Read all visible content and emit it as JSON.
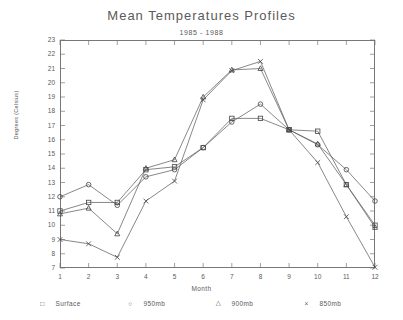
{
  "chart_data": {
    "type": "line",
    "title": "Mean Temperatures Profiles",
    "subtitle": "1985 - 1988",
    "xlabel": "Month",
    "ylabel": "Degrees (Celsius)",
    "xlim": [
      1,
      12
    ],
    "ylim": [
      7,
      23
    ],
    "ytick_step": 1,
    "grid": false,
    "legend_position": "below",
    "categories": [
      1,
      2,
      3,
      4,
      5,
      6,
      7,
      8,
      9,
      10,
      11,
      12
    ],
    "xticklabels": [
      "1",
      "2",
      "3",
      "4",
      "5",
      "6",
      "7",
      "8",
      "9",
      "10",
      "11",
      "12"
    ],
    "yticklabels": [
      "23",
      "22",
      "21",
      "20",
      "19",
      "18",
      "17",
      "16",
      "15",
      "14",
      "13",
      "12",
      "11",
      "10",
      "9",
      "8",
      "7"
    ],
    "series": [
      {
        "name": "Surface",
        "marker": "square",
        "values": [
          11.0,
          11.6,
          11.6,
          13.9,
          14.1,
          15.45,
          17.5,
          17.5,
          16.7,
          16.6,
          12.85,
          10.0
        ]
      },
      {
        "name": "950mb",
        "marker": "circle",
        "values": [
          12.0,
          12.85,
          11.4,
          13.4,
          13.9,
          15.45,
          17.25,
          18.5,
          16.7,
          15.65,
          13.9,
          11.7
        ]
      },
      {
        "name": "900mb",
        "marker": "triangle",
        "values": [
          10.8,
          11.2,
          9.4,
          14.0,
          14.6,
          19.0,
          20.9,
          21.0,
          16.7,
          15.7,
          12.85,
          9.85
        ]
      },
      {
        "name": "850mb",
        "marker": "cross",
        "values": [
          9.0,
          8.7,
          7.75,
          11.7,
          13.1,
          18.8,
          20.85,
          21.5,
          16.7,
          14.4,
          10.6,
          7.05
        ]
      }
    ]
  },
  "legend": [
    {
      "marker": "□",
      "label": "Surface"
    },
    {
      "marker": "○",
      "label": "950mb"
    },
    {
      "marker": "△",
      "label": "900mb"
    },
    {
      "marker": "×",
      "label": "850mb"
    }
  ]
}
